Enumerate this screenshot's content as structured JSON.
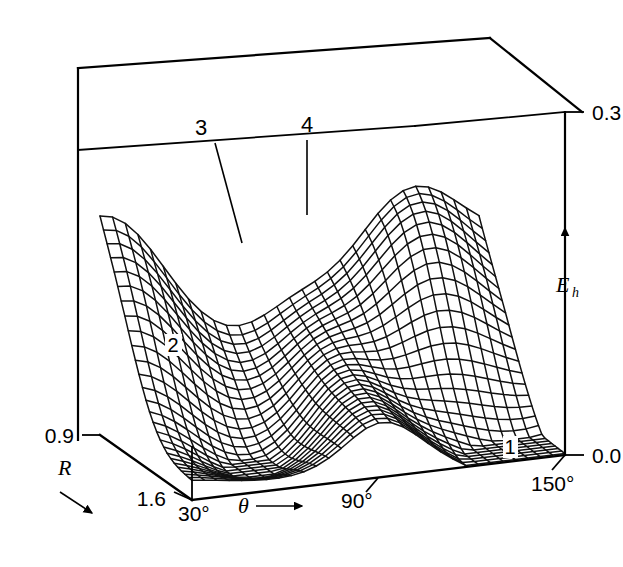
{
  "figure": {
    "kind": "3d-wireframe-surface-plot",
    "background_color": "#ffffff",
    "line_color": "#000000"
  },
  "axes": {
    "vertical": {
      "name": "E",
      "subscript": "h",
      "arrow": "up-arrow-icon",
      "min_label": "0.0",
      "max_label": "0.3",
      "min_value": 0.0,
      "max_value": 0.3
    },
    "depth": {
      "name": "R",
      "arrow": "down-right-arrow-icon",
      "min_label": "0.9",
      "max_label": "1.6",
      "min_value": 0.9,
      "max_value": 1.6
    },
    "horizontal": {
      "name": "θ",
      "arrow": "right-arrow-icon",
      "tick_labels": [
        "30°",
        "90°",
        "150°"
      ],
      "tick_values": [
        30,
        90,
        150
      ],
      "min_value": 30,
      "max_value": 150
    }
  },
  "point_labels": [
    {
      "id": "label-1",
      "text": "1",
      "boxed": true
    },
    {
      "id": "label-2",
      "text": "2",
      "boxed": true
    },
    {
      "id": "label-3",
      "text": "3",
      "boxed": false
    },
    {
      "id": "label-4",
      "text": "4",
      "boxed": false
    }
  ],
  "chart_data": {
    "type": "surface",
    "title": "",
    "xlabel": "θ",
    "ylabel": "R",
    "zlabel": "E_h",
    "xlim": [
      30,
      150
    ],
    "ylim": [
      0.9,
      1.6
    ],
    "zlim": [
      0.0,
      0.3
    ],
    "xticks": [
      30,
      90,
      150
    ],
    "xticklabels": [
      "30°",
      "90°",
      "150°"
    ],
    "yticks": [
      0.9,
      1.6
    ],
    "yticklabels": [
      "0.9",
      "1.6"
    ],
    "zticks": [
      0.0,
      0.3
    ],
    "zticklabels": [
      "0.0",
      "0.3"
    ],
    "grid": false,
    "legend": false,
    "mesh_nu": 30,
    "mesh_nv": 26,
    "annotations": [
      {
        "text": "1",
        "note": "stationary point near theta=150, low R, E near 0.0"
      },
      {
        "text": "2",
        "note": "stationary point in left valley, mid R"
      },
      {
        "text": "3",
        "note": "leader line to saddle region left of centre"
      },
      {
        "text": "4",
        "note": "leader line to ridge right of centre"
      }
    ]
  }
}
